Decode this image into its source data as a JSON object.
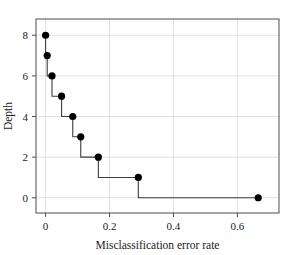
{
  "chart_data": {
    "type": "line",
    "title": "",
    "subtitle": "",
    "xlabel": "Misclassification error rate",
    "ylabel": "Depth",
    "xlim": [
      -0.03,
      0.73
    ],
    "ylim": [
      -0.75,
      8.8
    ],
    "xticks": [
      0,
      0.2,
      0.4,
      0.6
    ],
    "xticklabels": [
      "0",
      "0.2",
      "0.4",
      "0.6"
    ],
    "yticks": [
      0,
      2,
      4,
      6,
      8
    ],
    "yticklabels": [
      "0",
      "2",
      "4",
      "6",
      "8"
    ],
    "grid": true,
    "legend": null,
    "drawstyle": "steps-post",
    "marker": "filled-circle",
    "marker_color": "#000000",
    "line_color": "#3d3d3d",
    "x": [
      0.0,
      0.005,
      0.02,
      0.05,
      0.085,
      0.11,
      0.165,
      0.29,
      0.665
    ],
    "y": [
      8,
      7,
      6,
      5,
      4,
      3,
      2,
      1,
      0
    ],
    "points": [
      {
        "x": 0.0,
        "y": 8
      },
      {
        "x": 0.005,
        "y": 7
      },
      {
        "x": 0.02,
        "y": 6
      },
      {
        "x": 0.05,
        "y": 5
      },
      {
        "x": 0.085,
        "y": 4
      },
      {
        "x": 0.11,
        "y": 3
      },
      {
        "x": 0.165,
        "y": 2
      },
      {
        "x": 0.29,
        "y": 1
      },
      {
        "x": 0.665,
        "y": 0
      }
    ]
  }
}
